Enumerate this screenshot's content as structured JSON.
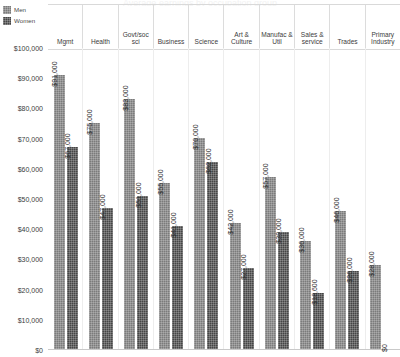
{
  "title_sliver": "Average earnings by occupation group",
  "legend": {
    "position": "top-left",
    "entries": [
      {
        "label": "Men",
        "color": "#7b7b7b",
        "icon": "legend-swatch"
      },
      {
        "label": "Women",
        "color": "#454545",
        "icon": "legend-swatch"
      }
    ]
  },
  "yaxis": {
    "ticks": [
      "$100,000",
      "$90,000",
      "$80,000",
      "$70,000",
      "$60,000",
      "$50,000",
      "$40,000",
      "$30,000",
      "$20,000",
      "$10,000",
      "$0"
    ]
  },
  "chart_data": {
    "type": "bar",
    "title": "Average earnings by occupation group",
    "xlabel": "",
    "ylabel": "",
    "ylim": [
      0,
      100000
    ],
    "ytick_step": 10000,
    "grid": false,
    "legend_position": "top-left",
    "categories": [
      "Mgmt",
      "Health",
      "Govt/soc sci",
      "Business",
      "Science",
      "Art & Culture",
      "Manufac & Util",
      "Sales & service",
      "Trades",
      "Primary Industry"
    ],
    "series": [
      {
        "name": "Men",
        "color": "#7b7b7b",
        "values": [
          91000,
          75000,
          83000,
          55000,
          70000,
          42000,
          57000,
          36000,
          46000,
          28000
        ],
        "labels": [
          "$91,000",
          "$75,000",
          "$83,000",
          "$55,000",
          "$70,000",
          "$42,000",
          "$57,000",
          "$36,000",
          "$46,000",
          "$28,000"
        ]
      },
      {
        "name": "Women",
        "color": "#454545",
        "values": [
          67000,
          47000,
          51000,
          41000,
          62000,
          27000,
          39000,
          18600,
          26000,
          0
        ],
        "labels": [
          "$67,000",
          "$47,000",
          "$51,000",
          "$41,000",
          "$62,000",
          "$27,000",
          "$39,000",
          "$18,600",
          "$26,000",
          "$0"
        ]
      }
    ]
  }
}
